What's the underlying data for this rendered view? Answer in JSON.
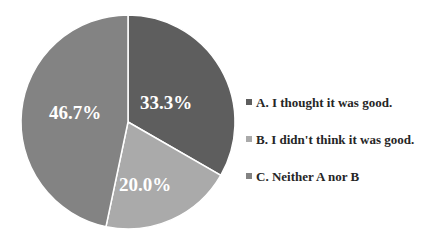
{
  "chart_data": {
    "type": "pie",
    "title": "",
    "categories": [
      "A. I thought it was good.",
      "B. I didn't think it was good.",
      "C. Neither A nor B"
    ],
    "values": [
      33.3,
      20.0,
      46.7
    ],
    "labels": [
      "33.3%",
      "20.0%",
      "46.7%"
    ],
    "colors": [
      "#5e5e5e",
      "#aaaaaa",
      "#838383"
    ],
    "start_angle_deg": 0,
    "direction": "clockwise",
    "legend_position": "right"
  },
  "legend": {
    "items": [
      {
        "label": "A. I thought it was good.",
        "color": "#5e5e5e"
      },
      {
        "label": "B. I didn't think it was good.",
        "color": "#aaaaaa"
      },
      {
        "label": "C. Neither A nor B",
        "color": "#838383"
      }
    ]
  }
}
